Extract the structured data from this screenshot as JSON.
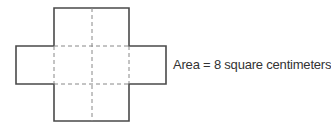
{
  "diagram": {
    "label": "Area = 8 square centimeters",
    "stroke_color": "#4a4a4a",
    "dash_color": "#888888",
    "shape": "cross-shaped net of 8 unit squares"
  }
}
